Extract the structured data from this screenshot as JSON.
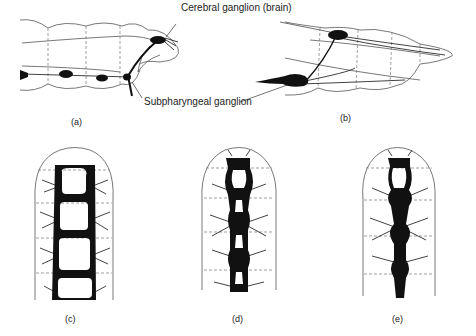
{
  "annotations": {
    "cerebral": "Cerebral ganglion (brain)",
    "subpharyngeal": "Subpharyngeal ganglion"
  },
  "captions": {
    "a": "(a)",
    "b": "(b)",
    "c": "(c)",
    "d": "(d)",
    "e": "(e)"
  },
  "colors": {
    "ink": "#111111",
    "outline": "#555555",
    "background": "#ffffff"
  }
}
